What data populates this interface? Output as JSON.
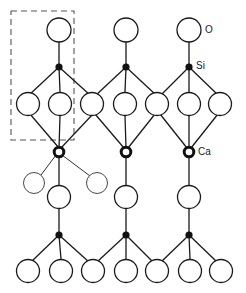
{
  "diagram": {
    "caption_fragment": "",
    "labels": {
      "oxygen": "O",
      "silicon": "Si",
      "calcium": "Ca"
    },
    "legend_colors": {
      "line": "#1a1a1a",
      "unit_cell_box": "#555555",
      "background": "#ffffff"
    },
    "atoms": {
      "top_oxygen": [
        [
          59,
          30
        ],
        [
          126,
          30
        ],
        [
          189,
          30
        ]
      ],
      "top_silicon": [
        [
          59,
          67
        ],
        [
          126,
          67
        ],
        [
          189,
          67
        ]
      ],
      "upper_oxygen_row": [
        [
          28,
          104
        ],
        [
          60,
          104
        ],
        [
          92,
          104
        ],
        [
          125,
          104
        ],
        [
          157,
          104
        ],
        [
          189,
          104
        ],
        [
          220,
          104
        ]
      ],
      "calcium": [
        [
          59,
          152
        ],
        [
          126,
          152
        ],
        [
          189,
          152
        ]
      ],
      "side_oxygen": [
        [
          36,
          183
        ],
        [
          96,
          183
        ]
      ],
      "lower_oxygen": [
        [
          59,
          197
        ],
        [
          126,
          197
        ],
        [
          189,
          197
        ]
      ],
      "bottom_silicon": [
        [
          59,
          235
        ],
        [
          126,
          235
        ],
        [
          189,
          235
        ]
      ],
      "bottom_oxygen_row": [
        [
          28,
          271
        ],
        [
          61,
          271
        ],
        [
          93,
          271
        ],
        [
          126,
          271
        ],
        [
          157,
          271
        ],
        [
          190,
          271
        ],
        [
          221,
          271
        ]
      ]
    },
    "unit_cell": {
      "x": 11,
      "y": 11,
      "width": 63,
      "height": 129
    }
  }
}
